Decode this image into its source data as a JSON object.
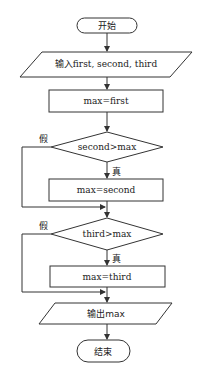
{
  "diagram": {
    "type": "flowchart",
    "nodes": {
      "start": {
        "shape": "terminal",
        "label": "开始"
      },
      "input": {
        "shape": "parallelogram",
        "label": "输入first, second, third"
      },
      "assign_first": {
        "shape": "process",
        "label": "max=first"
      },
      "cond_second": {
        "shape": "decision",
        "label": "second>max"
      },
      "assign_second": {
        "shape": "process",
        "label": "max=second"
      },
      "cond_third": {
        "shape": "decision",
        "label": "third>max"
      },
      "assign_third": {
        "shape": "process",
        "label": "max=third"
      },
      "output": {
        "shape": "parallelogram",
        "label": "输出max"
      },
      "end": {
        "shape": "terminal",
        "label": "结束"
      }
    },
    "branch_labels": {
      "true": "真",
      "false": "假"
    },
    "edges": [
      {
        "from": "start",
        "to": "input"
      },
      {
        "from": "input",
        "to": "assign_first"
      },
      {
        "from": "assign_first",
        "to": "cond_second"
      },
      {
        "from": "cond_second",
        "to": "assign_second",
        "label": "真"
      },
      {
        "from": "cond_second",
        "to": "cond_third",
        "label": "假"
      },
      {
        "from": "assign_second",
        "to": "cond_third"
      },
      {
        "from": "cond_third",
        "to": "assign_third",
        "label": "真"
      },
      {
        "from": "cond_third",
        "to": "output",
        "label": "假"
      },
      {
        "from": "assign_third",
        "to": "output"
      },
      {
        "from": "output",
        "to": "end"
      }
    ],
    "colors": {
      "stroke": "#333333",
      "background": "#ffffff",
      "text": "#222222"
    }
  }
}
